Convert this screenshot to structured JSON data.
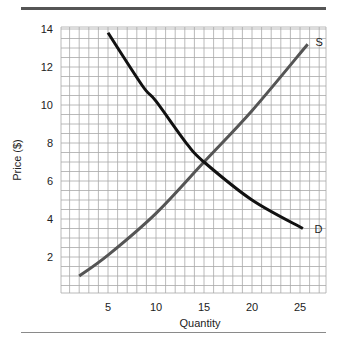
{
  "chart_data": {
    "type": "line",
    "title": "",
    "xlabel": "Quantity",
    "ylabel": "Price ($)",
    "xlim": [
      0,
      27.7
    ],
    "ylim": [
      0,
      14.1
    ],
    "xticks": [
      5,
      10,
      15,
      20,
      25
    ],
    "yticks": [
      2,
      4,
      6,
      8,
      10,
      12,
      14
    ],
    "grid": true,
    "grid_minor_x_step": 1,
    "grid_minor_y_step": 0.5,
    "legend": "none (curves labeled inline)",
    "series": [
      {
        "name": "S",
        "label": "S",
        "color": "#555555",
        "points": [
          [
            2,
            1.0
          ],
          [
            5,
            2.1
          ],
          [
            10,
            4.3
          ],
          [
            15,
            7.0
          ],
          [
            20,
            9.7
          ],
          [
            25.8,
            13.2
          ]
        ]
      },
      {
        "name": "D",
        "label": "D",
        "color": "#111111",
        "points": [
          [
            5,
            13.8
          ],
          [
            8.6,
            11.0
          ],
          [
            10,
            10.2
          ],
          [
            13.3,
            7.9
          ],
          [
            15,
            7.0
          ],
          [
            20,
            5.0
          ],
          [
            25.3,
            3.5
          ]
        ]
      }
    ],
    "annotations": [
      {
        "text": "S",
        "x": 26.4,
        "y": 13.3
      },
      {
        "text": "D",
        "x": 26.3,
        "y": 3.5
      }
    ],
    "equilibrium": {
      "quantity": 15,
      "price": 7
    }
  },
  "axes": {
    "x_label": "Quantity",
    "y_label": "Price ($)",
    "x_tick_labels": [
      "5",
      "10",
      "15",
      "20",
      "25"
    ],
    "y_tick_labels": [
      "2",
      "4",
      "6",
      "8",
      "10",
      "12",
      "14"
    ]
  },
  "colors": {
    "top_rule": "#555555",
    "bottom_rule": "#8a8a8a",
    "grid": "#a8a8a8",
    "supply": "#555555",
    "demand": "#111111"
  }
}
